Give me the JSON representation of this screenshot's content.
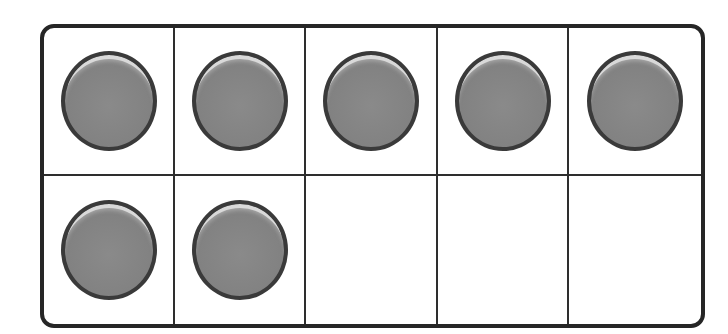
{
  "ten_frame": {
    "rows": 2,
    "columns": 5,
    "filled_count": 7,
    "empty_count": 3,
    "counter_color": "#828282",
    "border_color": "#262626",
    "cells": [
      {
        "row": 1,
        "col": 1,
        "filled": true
      },
      {
        "row": 1,
        "col": 2,
        "filled": true
      },
      {
        "row": 1,
        "col": 3,
        "filled": true
      },
      {
        "row": 1,
        "col": 4,
        "filled": true
      },
      {
        "row": 1,
        "col": 5,
        "filled": true
      },
      {
        "row": 2,
        "col": 1,
        "filled": true
      },
      {
        "row": 2,
        "col": 2,
        "filled": true
      },
      {
        "row": 2,
        "col": 3,
        "filled": false
      },
      {
        "row": 2,
        "col": 4,
        "filled": false
      },
      {
        "row": 2,
        "col": 5,
        "filled": false
      }
    ]
  }
}
